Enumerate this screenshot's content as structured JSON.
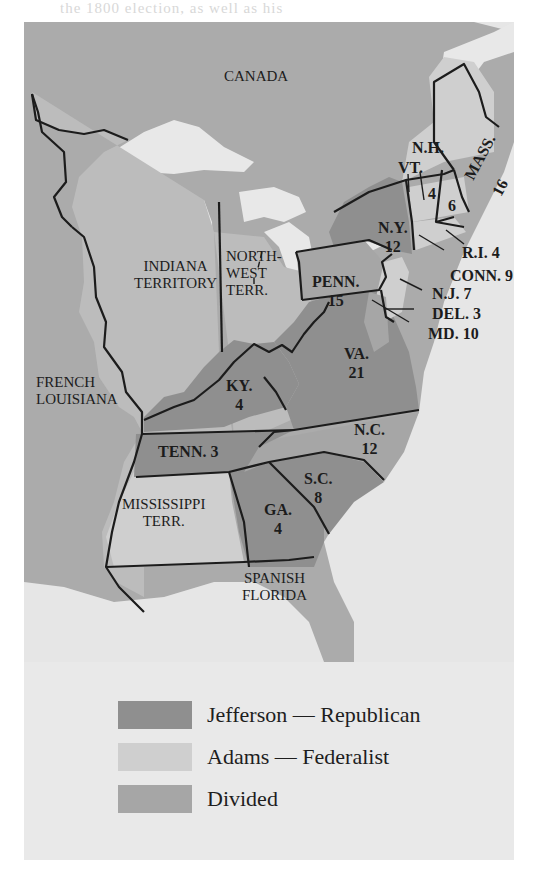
{
  "header": {
    "partial_text": "the 1800 election, as well as his"
  },
  "map": {
    "colors": {
      "jefferson_republican": "#8f8f8f",
      "adams_federalist": "#d0d0d0",
      "divided": "#a6a6a6",
      "territory": "#bcbcbc",
      "foreign_land": "#ababab",
      "water": "#e6e6e6",
      "border": "#1c1c1c"
    },
    "regions": {
      "canada": "CANADA",
      "french_louisiana_1": "FRENCH",
      "french_louisiana_2": "LOUISIANA",
      "indiana_1": "INDIANA",
      "indiana_2": "TERRITORY",
      "northwest_1": "NORTH-",
      "northwest_2": "WEST",
      "northwest_3": "TERR.",
      "mississippi_1": "MISSISSIPPI",
      "mississippi_2": "TERR.",
      "spanish_florida_1": "SPANISH",
      "spanish_florida_2": "FLORIDA"
    },
    "states": [
      {
        "abbr": "N.H.",
        "votes": "6",
        "result": "adams_federalist"
      },
      {
        "abbr": "VT.",
        "votes": "4",
        "result": "adams_federalist"
      },
      {
        "abbr": "MASS.",
        "votes": "16",
        "result": "adams_federalist"
      },
      {
        "abbr": "N.Y.",
        "votes": "12",
        "result": "jefferson_republican"
      },
      {
        "abbr": "R.I.",
        "votes": "4",
        "result": "adams_federalist"
      },
      {
        "abbr": "CONN.",
        "votes": "9",
        "result": "adams_federalist"
      },
      {
        "abbr": "PENN.",
        "votes": "15",
        "result": "divided"
      },
      {
        "abbr": "N.J.",
        "votes": "7",
        "result": "adams_federalist"
      },
      {
        "abbr": "DEL.",
        "votes": "3",
        "result": "adams_federalist"
      },
      {
        "abbr": "MD.",
        "votes": "10",
        "result": "divided"
      },
      {
        "abbr": "VA.",
        "votes": "21",
        "result": "jefferson_republican"
      },
      {
        "abbr": "KY.",
        "votes": "4",
        "result": "jefferson_republican"
      },
      {
        "abbr": "TENN.",
        "votes": "3",
        "result": "jefferson_republican"
      },
      {
        "abbr": "N.C.",
        "votes": "12",
        "result": "divided"
      },
      {
        "abbr": "S.C.",
        "votes": "8",
        "result": "jefferson_republican"
      },
      {
        "abbr": "GA.",
        "votes": "4",
        "result": "jefferson_republican"
      }
    ],
    "labels": {
      "nh": "N.H.",
      "vt": "VT.",
      "vt_votes": "4",
      "nh_votes": "6",
      "mass": "MASS.",
      "mass_votes": "16",
      "ny": "N.Y.",
      "ny_votes": "12",
      "ri": "R.I. 4",
      "conn": "CONN. 9",
      "penn": "PENN.",
      "penn_votes": "15",
      "nj": "N.J. 7",
      "del": "DEL. 3",
      "md": "MD. 10",
      "va": "VA.",
      "va_votes": "21",
      "ky": "KY.",
      "ky_votes": "4",
      "tenn": "TENN. 3",
      "nc": "N.C.",
      "nc_votes": "12",
      "sc": "S.C.",
      "sc_votes": "8",
      "ga": "GA.",
      "ga_votes": "4"
    }
  },
  "legend": {
    "items": [
      {
        "label": "Jefferson — Republican",
        "color": "#8f8f8f"
      },
      {
        "label": "Adams — Federalist",
        "color": "#cfcfcf"
      },
      {
        "label": "Divided",
        "color": "#a6a6a6"
      }
    ]
  }
}
